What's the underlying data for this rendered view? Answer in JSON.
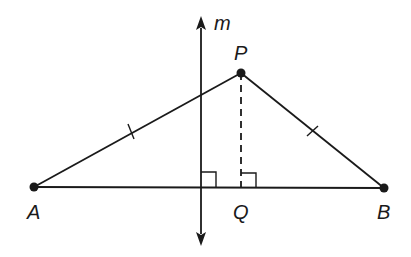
{
  "diagram": {
    "type": "geometry-figure",
    "colors": {
      "stroke": "#1a1a1a",
      "background": "#ffffff"
    },
    "points": {
      "A": {
        "label": "A",
        "x": 34,
        "y": 187
      },
      "P": {
        "label": "P",
        "x": 241,
        "y": 73
      },
      "B": {
        "label": "B",
        "x": 384,
        "y": 188
      },
      "Q": {
        "label": "Q",
        "x": 241,
        "y": 187
      }
    },
    "line_m": {
      "label": "m",
      "x": 201,
      "y_top": 16,
      "y_bottom": 246,
      "arrows": "both"
    },
    "segments": [
      {
        "from": "A",
        "to": "P",
        "style": "solid",
        "tick_marks": 1
      },
      {
        "from": "P",
        "to": "B",
        "style": "solid",
        "tick_marks": 1
      },
      {
        "from": "A",
        "to": "B",
        "style": "solid",
        "tick_marks": 0
      },
      {
        "from": "P",
        "to": "Q",
        "style": "dashed",
        "tick_marks": 0
      }
    ],
    "right_angles": [
      {
        "at": "intersection of m and AB",
        "x": 201,
        "y": 187
      },
      {
        "at": "Q",
        "x": 241,
        "y": 187
      }
    ],
    "labels": {
      "A": "A",
      "B": "B",
      "P": "P",
      "Q": "Q",
      "m": "m"
    }
  }
}
